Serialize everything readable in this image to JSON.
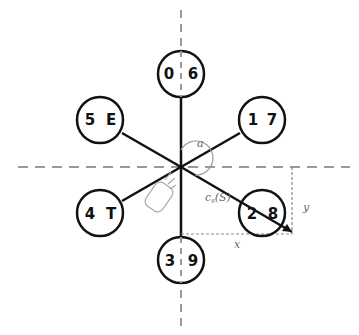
{
  "diagram": {
    "type": "radial-keyboard-layout",
    "center": {
      "x": 181,
      "y": 167
    },
    "nodes": [
      {
        "id": "top",
        "left": "0",
        "right": "6",
        "cx": 181,
        "cy": 74
      },
      {
        "id": "upper-right",
        "left": "1",
        "right": "7",
        "cx": 262,
        "cy": 120
      },
      {
        "id": "lower-right",
        "left": "2",
        "right": "8",
        "cx": 262,
        "cy": 213
      },
      {
        "id": "bottom",
        "left": "3",
        "right": "9",
        "cx": 181,
        "cy": 260
      },
      {
        "id": "lower-left",
        "left": "4",
        "right": "T",
        "cx": 100,
        "cy": 213
      },
      {
        "id": "upper-left",
        "left": "5",
        "right": "E",
        "cx": 100,
        "cy": 120
      }
    ],
    "annotations": {
      "angle_label": "a",
      "vector_label": "c",
      "vector_subscript": "s",
      "vector_arg": "(S)",
      "x_label": "x",
      "y_label": "y"
    },
    "colors": {
      "line": "#111111",
      "dashed": "#999999",
      "label": "#666666"
    }
  }
}
